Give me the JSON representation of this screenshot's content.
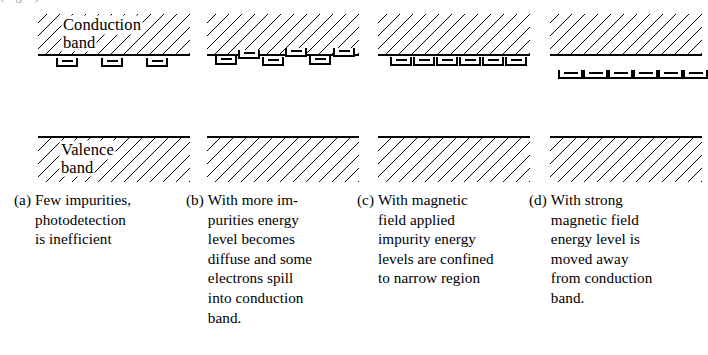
{
  "figure": {
    "top_cropped_text": "(Fig. 1)",
    "band_labels": {
      "conduction_line1": "Conduction",
      "conduction_line2": "band",
      "valence_line1": "Valence",
      "valence_line2": "band"
    },
    "panels": [
      {
        "tag": "(a)",
        "caption_lines": [
          "Few impurities,",
          "photodetection",
          "is inefficient"
        ],
        "impurity_count": 3,
        "impurity_arrangement": "sparse-below-band-edge",
        "impurities": [
          {
            "x": 18,
            "y": 58
          },
          {
            "x": 63,
            "y": 58
          },
          {
            "x": 108,
            "y": 58
          }
        ]
      },
      {
        "tag": "(b)",
        "caption_lines": [
          "With more im-",
          "purities energy",
          "level becomes",
          "diffuse and some",
          "electrons spill",
          "into conduction",
          "band."
        ],
        "impurity_count": 6,
        "impurity_arrangement": "staggered-straddling-band-edge",
        "impurities": [
          {
            "x": 8,
            "y": 56
          },
          {
            "x": 31,
            "y": 50
          },
          {
            "x": 55,
            "y": 57
          },
          {
            "x": 78,
            "y": 48
          },
          {
            "x": 102,
            "y": 56
          },
          {
            "x": 126,
            "y": 48
          }
        ]
      },
      {
        "tag": "(c)",
        "caption_lines": [
          "With magnetic",
          "field applied",
          "impurity energy",
          "levels are confined",
          "to narrow region"
        ],
        "impurity_count": 6,
        "impurity_arrangement": "aligned-row-at-band-edge",
        "impurities": [
          {
            "x": 12,
            "y": 57
          },
          {
            "x": 35,
            "y": 57
          },
          {
            "x": 58,
            "y": 57
          },
          {
            "x": 81,
            "y": 57
          },
          {
            "x": 104,
            "y": 57
          },
          {
            "x": 127,
            "y": 57
          }
        ]
      },
      {
        "tag": "(d)",
        "caption_lines": [
          "With strong",
          "magnetic field",
          "energy level is",
          "moved away",
          "from conduction",
          "band."
        ],
        "impurity_count": 6,
        "impurity_arrangement": "tight-row-moved-away-from-band",
        "impurities": [
          {
            "x": 8,
            "y": 70
          },
          {
            "x": 33,
            "y": 70
          },
          {
            "x": 58,
            "y": 70
          },
          {
            "x": 83,
            "y": 70
          },
          {
            "x": 108,
            "y": 70
          },
          {
            "x": 133,
            "y": 70
          }
        ]
      }
    ],
    "panel_x_positions": [
      38,
      207,
      378,
      550
    ],
    "caption_x_positions": [
      14,
      186,
      357,
      529
    ],
    "colors": {
      "ink": "#000000",
      "paper": "#ffffff"
    }
  }
}
